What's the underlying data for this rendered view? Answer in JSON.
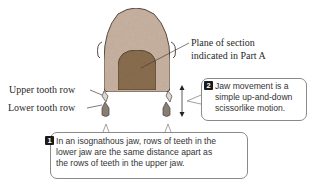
{
  "diagram": {
    "labels": {
      "plane_of_section_line1": "Plane of section",
      "plane_of_section_line2": "indicated in Part A",
      "upper_tooth_row": "Upper tooth row",
      "lower_tooth_row": "Lower tooth row"
    },
    "callouts": [
      {
        "number": "2",
        "lines": [
          "Jaw movement is a",
          "simple up-and-down",
          "scissorlike motion."
        ]
      },
      {
        "number": "1",
        "lines": [
          "In an isognathous jaw, rows of teeth in the",
          "lower jaw are the same distance apart as",
          "the rows of teeth in the upper jaw."
        ]
      }
    ],
    "colors": {
      "head_fill": "#c9b3a2",
      "section_fill": "#8a6e4e",
      "outline": "#5a4a40",
      "callout_border": "#8a8a8a",
      "number_badge": "#1a1a1a"
    }
  }
}
